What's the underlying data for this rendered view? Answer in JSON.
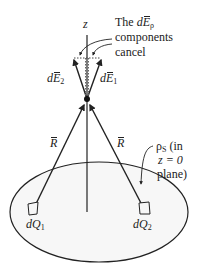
{
  "diagram": {
    "axis_label": "z",
    "annotation_top": {
      "line1_prefix": "The ",
      "line1_d": "d",
      "line1_E": "E",
      "line1_sub": "ρ",
      "line2": "components",
      "line3": "cancel"
    },
    "field_vectors": [
      {
        "d": "d",
        "E": "E",
        "sub": "2"
      },
      {
        "d": "d",
        "E": "E",
        "sub": "1"
      }
    ],
    "distance_vectors": [
      {
        "label": "R"
      },
      {
        "label": "R"
      }
    ],
    "charges": [
      {
        "d": "dQ",
        "sub": "1"
      },
      {
        "d": "dQ",
        "sub": "2"
      }
    ],
    "surface_annotation": {
      "rho": "ρ",
      "rho_sub": "S",
      "line1_rest": " (in",
      "line2": "z = 0",
      "line3": "plane)"
    },
    "colors": {
      "stroke": "#222222",
      "disk_fill": "#f7f7f7",
      "background": "#ffffff"
    }
  }
}
